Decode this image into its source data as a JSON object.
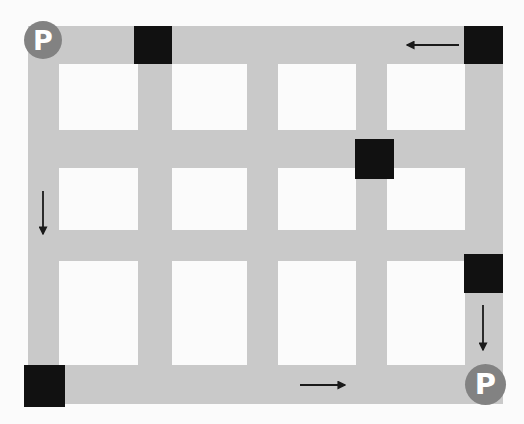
{
  "scene": {
    "title": "City street grid map with parking markers",
    "width": 524,
    "height": 424,
    "background_color": "#fbfbfb",
    "road_color": "#c9c9c9",
    "block_color": "#111111",
    "marker_color": "#828282",
    "marker_text_color": "#ffffff",
    "arrow_color": "#1a1a1a"
  },
  "roads": {
    "vertical": [
      {
        "name": "vertical-road-1",
        "x": 28,
        "y": 26,
        "w": 31,
        "h": 378
      },
      {
        "name": "vertical-road-2",
        "x": 138,
        "y": 26,
        "w": 34,
        "h": 378
      },
      {
        "name": "vertical-road-3",
        "x": 247,
        "y": 26,
        "w": 31,
        "h": 378
      },
      {
        "name": "vertical-road-4",
        "x": 356,
        "y": 26,
        "w": 31,
        "h": 378
      },
      {
        "name": "vertical-road-5",
        "x": 465,
        "y": 26,
        "w": 38,
        "h": 378
      }
    ],
    "horizontal": [
      {
        "name": "horizontal-road-1",
        "x": 28,
        "y": 26,
        "w": 475,
        "h": 38
      },
      {
        "name": "horizontal-road-2",
        "x": 28,
        "y": 130,
        "w": 475,
        "h": 38
      },
      {
        "name": "horizontal-road-3",
        "x": 28,
        "y": 230,
        "w": 475,
        "h": 31
      },
      {
        "name": "horizontal-road-4",
        "x": 28,
        "y": 365,
        "w": 475,
        "h": 39
      }
    ]
  },
  "blocks": [
    {
      "name": "black-block-top-center",
      "x": 134,
      "y": 26,
      "w": 38,
      "h": 38
    },
    {
      "name": "black-block-top-right",
      "x": 464,
      "y": 26,
      "w": 39,
      "h": 38
    },
    {
      "name": "black-block-middle",
      "x": 355,
      "y": 139,
      "w": 39,
      "h": 40
    },
    {
      "name": "black-block-right",
      "x": 464,
      "y": 254,
      "w": 39,
      "h": 39
    },
    {
      "name": "black-block-bottom-left",
      "x": 24,
      "y": 365,
      "w": 41,
      "h": 42
    }
  ],
  "markers": [
    {
      "name": "parking-marker-start",
      "label": "P",
      "x": 24,
      "y": 21,
      "size": 38,
      "font_size": 27
    },
    {
      "name": "parking-marker-end",
      "label": "P",
      "x": 465,
      "y": 364,
      "size": 41,
      "font_size": 29
    }
  ],
  "arrows": [
    {
      "name": "arrow-left-top",
      "direction": "left",
      "x1": 459,
      "y1": 45,
      "x2": 407,
      "y2": 45
    },
    {
      "name": "arrow-down-left",
      "direction": "down",
      "x1": 43,
      "y1": 191,
      "x2": 43,
      "y2": 234
    },
    {
      "name": "arrow-down-right",
      "direction": "down",
      "x1": 483,
      "y1": 305,
      "x2": 483,
      "y2": 350
    },
    {
      "name": "arrow-right-bottom",
      "direction": "right",
      "x1": 300,
      "y1": 385,
      "x2": 345,
      "y2": 385
    }
  ]
}
